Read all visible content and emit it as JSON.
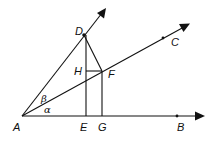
{
  "diagram": {
    "type": "geometry",
    "points": {
      "A": {
        "label": "A",
        "x": 22,
        "y": 116
      },
      "B": {
        "label": "B",
        "x": 177,
        "y": 116
      },
      "C": {
        "label": "C",
        "x": 163,
        "y": 38
      },
      "D": {
        "label": "D",
        "x": 84,
        "y": 35
      },
      "E": {
        "label": "E",
        "x": 86,
        "y": 116
      },
      "F": {
        "label": "F",
        "x": 102,
        "y": 71
      },
      "G": {
        "label": "G",
        "x": 102,
        "y": 116
      },
      "H": {
        "label": "H",
        "x": 86,
        "y": 71
      }
    },
    "angles": {
      "alpha": {
        "label": "α"
      },
      "beta": {
        "label": "β"
      }
    },
    "rays": [
      "AB",
      "AC",
      "AD"
    ],
    "segments": [
      "DE",
      "DF",
      "HF",
      "FG"
    ],
    "colors": {
      "stroke": "#111111",
      "background": "#ffffff"
    }
  }
}
